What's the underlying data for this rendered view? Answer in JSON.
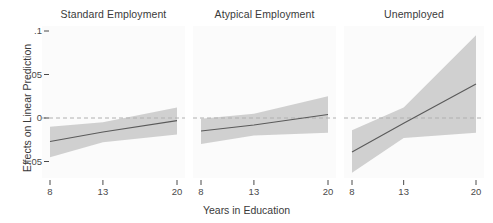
{
  "figure": {
    "xlabel": "Years in Education",
    "ylabel": "Effects on Linear Prediction",
    "cutoff_title": "",
    "colors": {
      "line": "#5a5a5a",
      "band": "#c8c8c8",
      "zero_line": "#b0b0b0",
      "axis_text": "#4a4a4a",
      "panel_bg": "#fbfbfb"
    }
  },
  "panels": [
    {
      "title": "Standard Employment"
    },
    {
      "title": "Atypical Employment"
    },
    {
      "title": "Unemployed"
    }
  ],
  "yticks": [
    {
      "value": 0.1,
      "label": ".1"
    },
    {
      "value": 0.05,
      "label": ".05"
    },
    {
      "value": 0,
      "label": "0"
    },
    {
      "value": -0.05,
      "label": "-.05"
    }
  ],
  "xticks": [
    {
      "value": 8,
      "label": "8"
    },
    {
      "value": 13,
      "label": "13"
    },
    {
      "value": 20,
      "label": "20"
    }
  ],
  "chart_data": {
    "type": "line",
    "title": "",
    "xlabel": "Years in Education",
    "ylabel": "Effects on Linear Prediction",
    "xlim": [
      8,
      20
    ],
    "ylim": [
      -0.068,
      0.108
    ],
    "grid": false,
    "legend": "none",
    "reference_line": {
      "y": 0,
      "style": "dashed"
    },
    "panel_layout": "1x3 small multiples, shared y-axis",
    "x": [
      8,
      13,
      20
    ],
    "series": [
      {
        "name": "Standard Employment",
        "panel": 0,
        "values": [
          -0.027,
          -0.016,
          -0.003
        ],
        "ci_lower": [
          -0.045,
          -0.028,
          -0.019
        ],
        "ci_upper": [
          -0.01,
          -0.005,
          0.012
        ]
      },
      {
        "name": "Atypical Employment",
        "panel": 1,
        "values": [
          -0.015,
          -0.008,
          0.004
        ],
        "ci_lower": [
          -0.03,
          -0.02,
          -0.017
        ],
        "ci_upper": [
          -0.001,
          0.005,
          0.025
        ]
      },
      {
        "name": "Unemployed",
        "panel": 2,
        "values": [
          -0.039,
          -0.006,
          0.039
        ],
        "ci_lower": [
          -0.063,
          -0.023,
          -0.017
        ],
        "ci_upper": [
          -0.014,
          0.012,
          0.095
        ]
      }
    ]
  }
}
